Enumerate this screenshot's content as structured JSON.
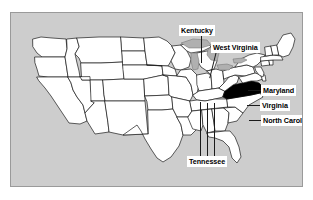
{
  "figure": {
    "background_color": "#ffffff",
    "panel_color": "#cdcdcd",
    "panel_border_color": "#9a9a9a",
    "state_fill_color": "#ffffff",
    "state_border_color": "#1a1a1a",
    "highlight_color": "#000000",
    "lake_color": "#b0b0b0",
    "label_box_color": "#ffffff",
    "label_text_color": "#000000",
    "leader_line_color": "#1a1a1a"
  },
  "map": {
    "region": "Contiguous United States",
    "highlighted_states": [
      "Virginia"
    ],
    "labels": [
      {
        "id": "kentucky",
        "text": "Kentucky"
      },
      {
        "id": "west-virginia",
        "text": "West Virginia"
      },
      {
        "id": "maryland",
        "text": "Maryland"
      },
      {
        "id": "virginia",
        "text": "Virginia"
      },
      {
        "id": "north-carolina",
        "text": "North Carolina"
      },
      {
        "id": "tennessee",
        "text": "Tennessee"
      }
    ]
  }
}
